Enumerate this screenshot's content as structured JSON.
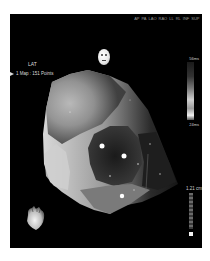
{
  "viewer": {
    "view_buttons": [
      "AP",
      "PA",
      "LAO",
      "RAO",
      "LL",
      "RL",
      "INF",
      "SUP"
    ],
    "map_type": "LAT",
    "map_info": "1 Map : 151 Points",
    "colorbar": {
      "max_label": "56ms",
      "min_label": "24ms"
    },
    "scale": {
      "label": "1.21 cm"
    },
    "icons": {
      "orientation_head": "head-orientation-icon",
      "heart_model": "heart-orientation-icon",
      "map_arrow": "triangle-right-icon"
    },
    "colors": {
      "background": "#000000",
      "page": "#ffffff",
      "text": "#dcdcdc"
    }
  }
}
